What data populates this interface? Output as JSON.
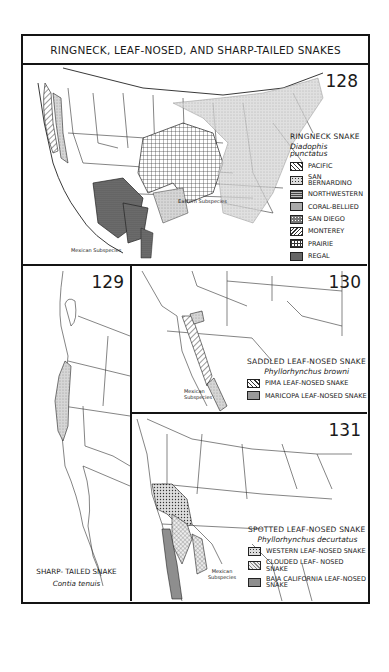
{
  "title": "RINGNECK, LEAF-NOSED, AND SHARP-TAILED SNAKES",
  "maps": [
    {
      "number": "128",
      "common_name": "RINGNECK SNAKE",
      "scientific_name": "Diadophis punctatus",
      "legend": [
        {
          "label": "PACIFIC",
          "pattern": "diagonal-hatch-light"
        },
        {
          "label": "SAN BERNARDINO",
          "pattern": "dotted-grid"
        },
        {
          "label": "NORTHWESTERN",
          "pattern": "dense-grid"
        },
        {
          "label": "CORAL-BELLIED",
          "pattern": "fine-stipple"
        },
        {
          "label": "SAN DIEGO",
          "pattern": "coarse-dot"
        },
        {
          "label": "MONTEREY",
          "pattern": "diagonal-hatch-dense"
        },
        {
          "label": "PRAIRIE",
          "pattern": "crosshatch-grid"
        },
        {
          "label": "REGAL",
          "pattern": "dark-stipple"
        }
      ],
      "annotations": [
        "Eastern Subspecies",
        "Mexican Subspecies"
      ]
    },
    {
      "number": "129",
      "common_name": "SHARP- TAILED SNAKE",
      "scientific_name": "Contia tenuis"
    },
    {
      "number": "130",
      "common_name": "SADDLED LEAF-NOSED SNAKE",
      "scientific_name": "Phyllorhynchus browni",
      "legend": [
        {
          "label": "PIMA LEAF-NOSED SNAKE",
          "pattern": "diagonal-hatch-light"
        },
        {
          "label": "MARICOPA LEAF-NOSED SNAKE",
          "pattern": "gray-stipple"
        }
      ],
      "annotations": [
        "Mexican Subspecies"
      ]
    },
    {
      "number": "131",
      "common_name": "SPOTTED LEAF-NOSED SNAKE",
      "scientific_name": "Phyllorhynchus decurtatus",
      "legend": [
        {
          "label": "WESTERN LEAF-NOSED SNAKE",
          "pattern": "dotted-grid"
        },
        {
          "label": "CLOUDED LEAF- NOSED SNAKE",
          "pattern": "light-crosshatch"
        },
        {
          "label": "BAJA CALIFORNIA LEAF-NOSED SNAKE",
          "pattern": "solid-gray"
        }
      ],
      "annotations": [
        "Mexican Subspecies"
      ]
    }
  ],
  "colors": {
    "ink": "#141414",
    "range_gray": "#9a9a9a",
    "light_gray": "#c9c9c9",
    "paper": "#ffffff"
  }
}
